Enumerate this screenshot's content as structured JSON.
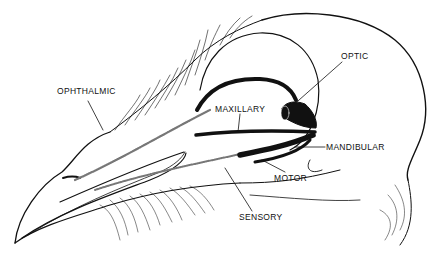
{
  "diagram": {
    "colors": {
      "ink": "#111111",
      "background": "#ffffff"
    },
    "labels": [
      {
        "id": "ophthalmic",
        "text": "OPHTHALMIC",
        "x": 57,
        "y": 90
      },
      {
        "id": "optic",
        "text": "OPTIC",
        "x": 341,
        "y": 53
      },
      {
        "id": "maxillary",
        "text": "MAXILLARY",
        "x": 216,
        "y": 106
      },
      {
        "id": "mandibular",
        "text": "MANDIBULAR",
        "x": 326,
        "y": 144
      },
      {
        "id": "motor",
        "text": "MOTOR",
        "x": 274,
        "y": 175
      },
      {
        "id": "sensory",
        "text": "SENSORY",
        "x": 239,
        "y": 214
      }
    ]
  }
}
